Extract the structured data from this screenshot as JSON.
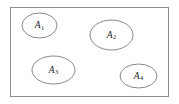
{
  "figure": {
    "type": "set-diagram",
    "background_color": "#ffffff",
    "universal_set": {
      "name": "universal-set-rectangle",
      "x": 10,
      "y": 7,
      "width": 158,
      "height": 89,
      "stroke_color": "#8c8c8c",
      "stroke_width": 1,
      "fill": "none"
    },
    "label_color": "#1a1a1a",
    "ellipse_stroke_color": "#7a7a7a",
    "ellipse_stroke_width": 0.9,
    "regions": [
      {
        "id": "A1",
        "label_base": "A",
        "label_sub": "1",
        "cx": 39.5,
        "cy": 25.5,
        "rx": 17.5,
        "ry": 12.5
      },
      {
        "id": "A2",
        "label_base": "A",
        "label_sub": "2",
        "cx": 111.5,
        "cy": 35.0,
        "rx": 21.5,
        "ry": 15.0
      },
      {
        "id": "A3",
        "label_base": "A",
        "label_sub": "3",
        "cx": 53.5,
        "cy": 70.0,
        "rx": 21.5,
        "ry": 14.0
      },
      {
        "id": "A4",
        "label_base": "A",
        "label_sub": "4",
        "cx": 138.5,
        "cy": 76.0,
        "rx": 18.5,
        "ry": 12.0
      }
    ]
  }
}
